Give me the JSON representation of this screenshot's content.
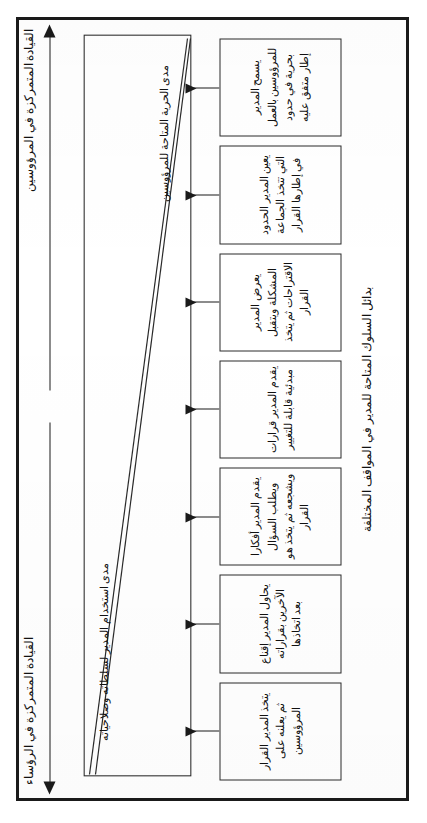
{
  "diagram": {
    "caption": "بدائل السلوك المتاحة للمدير في المواقف المختلفة",
    "axes": {
      "subordinate_centered": "القيادة المتمركزة في المرؤوسين",
      "boss_centered": "القيادة المتمركزة في الرؤساء"
    },
    "wedge": {
      "manager_authority": "مدى استخدام المدير لسلطاته وصلاحياته",
      "subordinate_freedom": "مدى الحرية المتاحة للمرؤوسين"
    },
    "boxes": [
      {
        "id": "box-1",
        "text": "يتخذ المدير القرار ثم يعلنه على المرؤوسين"
      },
      {
        "id": "box-2",
        "text": "يحاول المدير إقناع الآخرين بقراراته بعد اتخاذها"
      },
      {
        "id": "box-3",
        "text": "يقدم المدير أفكارا ويطلب السؤال ويشجعه ثم يتخذ هو القرار"
      },
      {
        "id": "box-4",
        "text": "يقدم المدير قرارات مبدئية قابلة للتغيير"
      },
      {
        "id": "box-5",
        "text": "يعرض المدير المشكلة ويتقبل الاقتراحات ثم يتخذ القرار"
      },
      {
        "id": "box-6",
        "text": "يعين المدير الحدود التي تتخذ الجماعة في إطارها القرار"
      },
      {
        "id": "box-7",
        "text": "يسمح المدير للمرؤوسين بالعمل بحرية في حدود إطار متفق عليه"
      }
    ]
  },
  "colors": {
    "ink": "#1a1a1a",
    "frame": "#1a1a1a",
    "paper": "#ffffff"
  }
}
